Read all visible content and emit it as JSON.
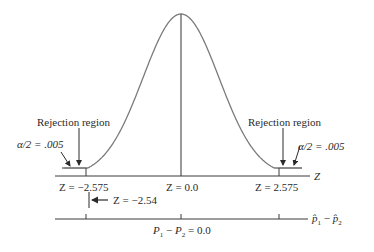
{
  "diagram": {
    "type": "two-tailed normal distribution with rejection regions",
    "curve": {
      "peak_x": 181,
      "peak_y": 14,
      "baseline_y": 176,
      "sigma_px": 38
    },
    "left_rejection": {
      "label": "Rejection region",
      "alpha_label": "α/2 = .005"
    },
    "right_rejection": {
      "label": "Rejection region",
      "alpha_label": "α/2 = .005"
    },
    "z_axis": {
      "axis_label": "Z",
      "ticks": [
        {
          "label": "Z = −2.575",
          "value": -2.575
        },
        {
          "label": "Z = 0.0",
          "value": 0.0
        },
        {
          "label": "Z = 2.575",
          "value": 2.575
        }
      ]
    },
    "test_statistic": {
      "label": "Z = −2.54",
      "value": -2.54
    },
    "p_axis": {
      "axis_label_p1": "p̂",
      "axis_label_sub1": "1",
      "axis_label_minus": "−",
      "axis_label_p2": "p̂",
      "axis_label_sub2": "2",
      "center_label_p1": "P",
      "center_label_sub1": "1",
      "center_label_minus": " − ",
      "center_label_p2": "P",
      "center_label_sub2": "2",
      "center_label_eq": " = 0.0"
    },
    "colors": {
      "curve": "#7a7a7a",
      "axis": "#3a3a3a",
      "text": "#2a2a2a"
    }
  }
}
